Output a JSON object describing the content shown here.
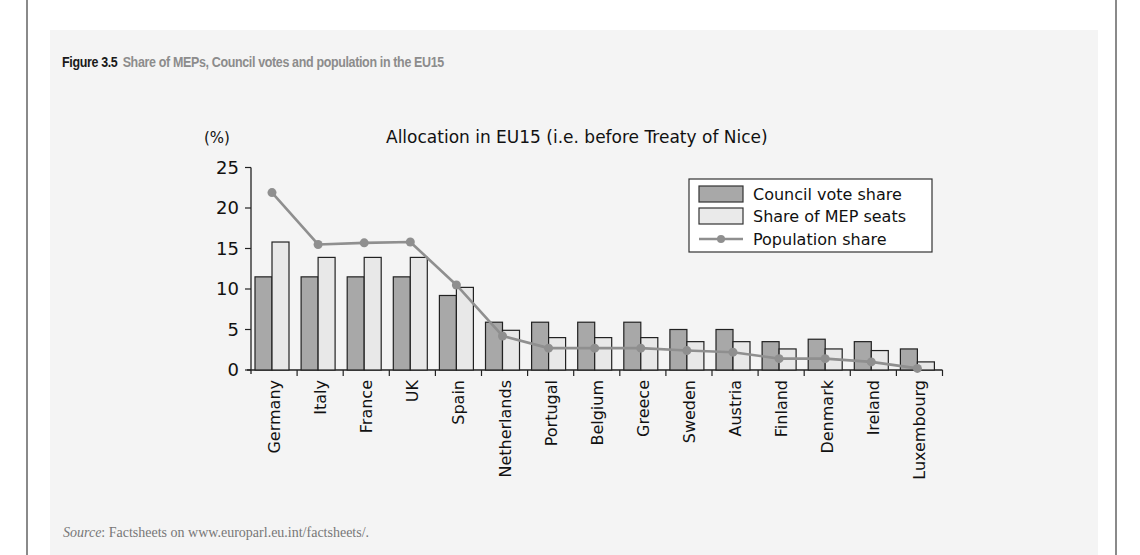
{
  "figure": {
    "number": "Figure 3.5",
    "title": "Share of MEPs, Council votes and population in the EU15",
    "source_label": "Source",
    "source_text": ": Factsheets on www.europarl.eu.int/factsheets/."
  },
  "colors": {
    "council": "#a8a8a8",
    "mep": "#e8e8e8",
    "population": "#8f8f8f",
    "panel": "#f4f4f4"
  },
  "chart_data": {
    "type": "bar",
    "title": "Allocation in EU15 (i.e. before Treaty of Nice)",
    "xlabel": "",
    "ylabel": "(%)",
    "ylim": [
      0,
      25
    ],
    "yticks": [
      0,
      5,
      10,
      15,
      20,
      25
    ],
    "grid": false,
    "legend_position": "upper right",
    "categories": [
      "Germany",
      "Italy",
      "France",
      "UK",
      "Spain",
      "Netherlands",
      "Portugal",
      "Belgium",
      "Greece",
      "Sweden",
      "Austria",
      "Finland",
      "Denmark",
      "Ireland",
      "Luxembourg"
    ],
    "series": [
      {
        "name": "Council vote share",
        "type": "bar",
        "values": [
          11.5,
          11.5,
          11.5,
          11.5,
          9.2,
          5.9,
          5.9,
          5.9,
          5.9,
          5.0,
          5.0,
          3.5,
          3.8,
          3.5,
          2.6
        ]
      },
      {
        "name": "Share of MEP seats",
        "type": "bar",
        "values": [
          15.8,
          13.9,
          13.9,
          13.9,
          10.2,
          4.9,
          4.0,
          4.0,
          4.0,
          3.5,
          3.5,
          2.6,
          2.6,
          2.4,
          1.0
        ]
      },
      {
        "name": "Population share",
        "type": "line",
        "values": [
          21.9,
          15.5,
          15.7,
          15.8,
          10.5,
          4.2,
          2.7,
          2.7,
          2.7,
          2.4,
          2.2,
          1.4,
          1.4,
          1.0,
          0.2
        ]
      }
    ]
  }
}
